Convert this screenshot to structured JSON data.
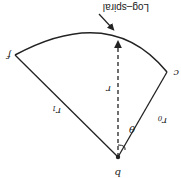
{
  "diagram": {
    "orientation": "rotated-180",
    "title": "Log–spiral",
    "points": {
      "apex": {
        "label": "b"
      },
      "left_end": {
        "label": "f"
      },
      "right_end": {
        "label": "c"
      }
    },
    "labels": {
      "radius": "r",
      "radius_1": "r",
      "radius_1_sub": "1",
      "radius_0": "r",
      "radius_0_sub": "0",
      "angle": "θ"
    },
    "colors": {
      "stroke": "#222222",
      "background": "#ffffff"
    }
  }
}
